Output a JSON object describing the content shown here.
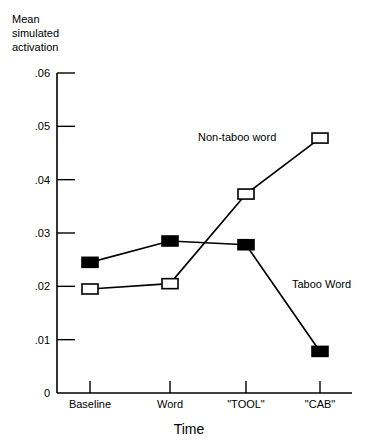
{
  "chart_data": {
    "type": "line",
    "title": "",
    "xlabel": "Time",
    "ylabel": "Mean\nsimulated\nactivation",
    "categories": [
      "Baseline",
      "Word",
      "\"TOOL\"",
      "\"CAB\""
    ],
    "ytick_labels": [
      "0",
      ".01",
      ".02",
      ".03",
      ".04",
      ".05",
      ".06"
    ],
    "ytick_values": [
      0,
      0.01,
      0.02,
      0.03,
      0.04,
      0.05,
      0.06
    ],
    "ylim": [
      0,
      0.06
    ],
    "grid": false,
    "legend_position": "inline-annotation",
    "series": [
      {
        "name": "Taboo Word",
        "marker": "filled-square",
        "marker_color": "#000000",
        "line_color": "#000000",
        "values": [
          0.0245,
          0.0285,
          0.0278,
          0.0078
        ],
        "label_x": 292,
        "label_y": 278
      },
      {
        "name": "Non-taboo word",
        "marker": "open-square",
        "marker_color": "#ffffff",
        "line_color": "#000000",
        "values": [
          0.0195,
          0.0205,
          0.0373,
          0.0478
        ],
        "label_x": 198,
        "label_y": 131
      }
    ]
  },
  "geometry": {
    "x_positions": [
      90,
      170,
      246,
      320
    ],
    "axis_left": 57,
    "axis_right": 352,
    "axis_top": 73,
    "axis_bottom": 393,
    "y_per_unit": 5333.33,
    "ytick_label_x": 50
  },
  "colors": {
    "axis": "#000000",
    "background": "#ffffff",
    "series_filled": "#000000",
    "series_open": "#ffffff"
  }
}
